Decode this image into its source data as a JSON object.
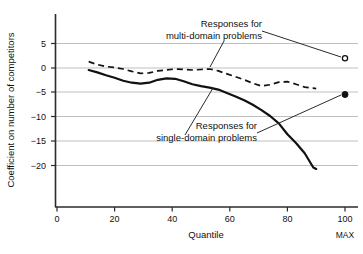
{
  "chart_data": {
    "type": "line",
    "title": "",
    "xlabel": "Quantile",
    "ylabel": "Coefficient on number of competitors",
    "xlim": [
      0,
      104
    ],
    "ylim": [
      -27,
      7.5
    ],
    "xticks": [
      0,
      20,
      40,
      60,
      80,
      100
    ],
    "xticklabels": [
      "0",
      "20",
      "40",
      "60",
      "80",
      "100"
    ],
    "yticks": [
      5,
      0,
      -5,
      -10,
      -15,
      -20
    ],
    "yticklabels": [
      "5",
      "0",
      "−5",
      "−10",
      "−15",
      "−20"
    ],
    "grid": "horizontal",
    "legend": "annotations",
    "extra_xlabel": "MAX",
    "series": [
      {
        "name": "Responses for multi-domain problems",
        "style": "dashed",
        "color": "#111111",
        "x": [
          11,
          14,
          17,
          20,
          23,
          26,
          29,
          32,
          35,
          38,
          41,
          44,
          47,
          50,
          53,
          56,
          59,
          62,
          65,
          68,
          71,
          74,
          77,
          80,
          83,
          86,
          89,
          90
        ],
        "y": [
          1.3,
          0.7,
          0.3,
          0.1,
          -0.2,
          -0.7,
          -1.1,
          -1.0,
          -0.6,
          -0.4,
          -0.2,
          -0.3,
          -0.4,
          -0.3,
          -0.2,
          -0.6,
          -1.2,
          -1.8,
          -2.4,
          -3.1,
          -3.7,
          -3.4,
          -2.9,
          -2.8,
          -3.3,
          -3.9,
          -4.1,
          -4.2
        ]
      },
      {
        "name": "Responses for single-domain problems",
        "style": "solid",
        "color": "#111111",
        "x": [
          11,
          14,
          17,
          20,
          23,
          26,
          29,
          32,
          35,
          38,
          41,
          44,
          47,
          50,
          53,
          56,
          59,
          62,
          65,
          68,
          71,
          74,
          77,
          80,
          83,
          86,
          89,
          90
        ],
        "y": [
          -0.4,
          -0.9,
          -1.5,
          -2.0,
          -2.6,
          -3.0,
          -3.2,
          -3.0,
          -2.4,
          -2.1,
          -2.2,
          -2.7,
          -3.3,
          -3.7,
          -4.0,
          -4.4,
          -5.1,
          -5.8,
          -6.6,
          -7.5,
          -8.6,
          -9.8,
          -11.3,
          -13.5,
          -15.3,
          -17.4,
          -20.3,
          -20.6
        ]
      }
    ],
    "points": [
      {
        "name": "multi-domain-max-point",
        "marker": "open-circle",
        "x": 100,
        "y": 2.0
      },
      {
        "name": "single-domain-max-point",
        "marker": "filled-circle",
        "x": 100,
        "y": -5.4
      }
    ],
    "annotations": [
      {
        "name": "multi-domain-annotation",
        "line1": "Responses for",
        "line2": "multi-domain problems"
      },
      {
        "name": "single-domain-annotation",
        "line1": "Responses for",
        "line2": "single-domain problems"
      }
    ]
  }
}
